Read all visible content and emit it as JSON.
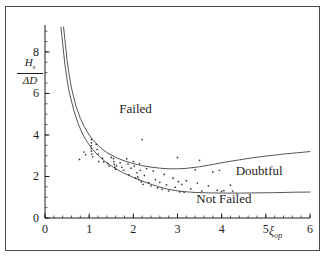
{
  "figure": {
    "background": "#ffffff",
    "border_color": "#4a4a4a",
    "ink_color": "#1c1c1c",
    "curve_color": "#555555",
    "point_color": "#333333"
  },
  "axes": {
    "y_title_numerator": "H",
    "y_title_numerator_sub": "s",
    "y_title_denominator": "ΔD",
    "x_title": "ξ",
    "x_title_sub": "op",
    "x_ticks": [
      0,
      1,
      2,
      3,
      4,
      5,
      6
    ],
    "x_tick_labels": [
      "0",
      "1",
      "2",
      "3",
      "4",
      "5",
      "6"
    ],
    "y_ticks": [
      0,
      2,
      4,
      6,
      8
    ],
    "y_tick_labels": [
      "0",
      "2",
      "4",
      "6",
      "8"
    ],
    "x_minor_step": 0.2,
    "y_minor_step": 0.5,
    "xlim": [
      0,
      6
    ],
    "ylim": [
      0,
      9.2
    ]
  },
  "regions": [
    {
      "name": "failed",
      "label": "Failed",
      "x": 2.05,
      "y": 5.05
    },
    {
      "name": "doubtful",
      "label": "Doubtful",
      "x": 4.85,
      "y": 2.05
    },
    {
      "name": "not-failed",
      "label": "Not Failed",
      "x": 4.05,
      "y": 0.72
    }
  ],
  "chart_data": {
    "type": "scatter",
    "title": "",
    "xlabel": "ξ_op",
    "ylabel": "H_s / ΔD",
    "xlim": [
      0,
      6
    ],
    "ylim": [
      0,
      9.2
    ],
    "grid": false,
    "legend": null,
    "series": [
      {
        "name": "upper-boundary-curve",
        "type": "line",
        "comment": "Boundary between Failed (above) and Doubtful (below)",
        "points": [
          [
            0.42,
            9.2
          ],
          [
            0.45,
            8.6
          ],
          [
            0.5,
            7.6
          ],
          [
            0.55,
            6.85
          ],
          [
            0.6,
            6.25
          ],
          [
            0.7,
            5.4
          ],
          [
            0.8,
            4.8
          ],
          [
            0.9,
            4.35
          ],
          [
            1.0,
            4.0
          ],
          [
            1.1,
            3.72
          ],
          [
            1.25,
            3.4
          ],
          [
            1.4,
            3.15
          ],
          [
            1.6,
            2.92
          ],
          [
            1.8,
            2.75
          ],
          [
            2.0,
            2.62
          ],
          [
            2.2,
            2.52
          ],
          [
            2.4,
            2.45
          ],
          [
            2.6,
            2.4
          ],
          [
            2.8,
            2.37
          ],
          [
            3.0,
            2.37
          ],
          [
            3.2,
            2.39
          ],
          [
            3.5,
            2.47
          ],
          [
            3.8,
            2.58
          ],
          [
            4.1,
            2.7
          ],
          [
            4.4,
            2.8
          ],
          [
            4.7,
            2.9
          ],
          [
            5.0,
            2.98
          ],
          [
            5.4,
            3.08
          ],
          [
            5.7,
            3.14
          ],
          [
            6.0,
            3.2
          ]
        ]
      },
      {
        "name": "lower-boundary-curve",
        "type": "line",
        "comment": "Boundary between Doubtful (above) and Not Failed (below)",
        "points": [
          [
            0.36,
            9.2
          ],
          [
            0.4,
            8.4
          ],
          [
            0.45,
            7.4
          ],
          [
            0.5,
            6.65
          ],
          [
            0.55,
            6.05
          ],
          [
            0.65,
            5.2
          ],
          [
            0.75,
            4.55
          ],
          [
            0.85,
            4.05
          ],
          [
            0.95,
            3.68
          ],
          [
            1.05,
            3.38
          ],
          [
            1.2,
            3.02
          ],
          [
            1.35,
            2.74
          ],
          [
            1.55,
            2.44
          ],
          [
            1.75,
            2.2
          ],
          [
            1.95,
            2.0
          ],
          [
            2.15,
            1.82
          ],
          [
            2.35,
            1.66
          ],
          [
            2.55,
            1.52
          ],
          [
            2.75,
            1.4
          ],
          [
            2.95,
            1.32
          ],
          [
            3.15,
            1.27
          ],
          [
            3.4,
            1.23
          ],
          [
            3.7,
            1.21
          ],
          [
            4.0,
            1.2
          ],
          [
            4.4,
            1.2
          ],
          [
            4.8,
            1.21
          ],
          [
            5.2,
            1.22
          ],
          [
            5.6,
            1.24
          ],
          [
            6.0,
            1.25
          ]
        ]
      },
      {
        "name": "data-points",
        "type": "scatter",
        "marker": "dot",
        "points": [
          [
            0.78,
            2.82
          ],
          [
            0.88,
            3.18
          ],
          [
            0.92,
            3.05
          ],
          [
            1.05,
            3.78
          ],
          [
            1.05,
            3.62
          ],
          [
            1.05,
            3.48
          ],
          [
            1.05,
            3.35
          ],
          [
            1.05,
            3.22
          ],
          [
            1.06,
            3.08
          ],
          [
            1.08,
            2.95
          ],
          [
            1.16,
            3.55
          ],
          [
            1.18,
            3.3
          ],
          [
            1.2,
            3.08
          ],
          [
            1.22,
            2.72
          ],
          [
            1.3,
            2.88
          ],
          [
            1.33,
            2.7
          ],
          [
            1.42,
            2.62
          ],
          [
            1.45,
            2.5
          ],
          [
            1.5,
            2.92
          ],
          [
            1.55,
            2.86
          ],
          [
            1.56,
            2.72
          ],
          [
            1.57,
            2.58
          ],
          [
            1.58,
            2.45
          ],
          [
            1.6,
            2.35
          ],
          [
            1.62,
            2.52
          ],
          [
            1.7,
            2.66
          ],
          [
            1.74,
            2.44
          ],
          [
            1.78,
            2.3
          ],
          [
            1.85,
            2.85
          ],
          [
            1.88,
            2.6
          ],
          [
            1.9,
            2.08
          ],
          [
            1.95,
            2.4
          ],
          [
            2.0,
            2.72
          ],
          [
            2.02,
            2.5
          ],
          [
            2.05,
            1.92
          ],
          [
            2.08,
            2.18
          ],
          [
            2.1,
            1.98
          ],
          [
            2.12,
            1.86
          ],
          [
            2.14,
            2.62
          ],
          [
            2.16,
            2.3
          ],
          [
            2.18,
            1.74
          ],
          [
            2.2,
            3.78
          ],
          [
            2.22,
            1.62
          ],
          [
            2.25,
            2.05
          ],
          [
            2.3,
            2.38
          ],
          [
            2.35,
            1.7
          ],
          [
            2.4,
            1.55
          ],
          [
            2.45,
            2.26
          ],
          [
            2.5,
            1.85
          ],
          [
            2.55,
            1.45
          ],
          [
            2.6,
            1.72
          ],
          [
            2.65,
            1.38
          ],
          [
            2.7,
            2.1
          ],
          [
            2.75,
            1.6
          ],
          [
            2.8,
            1.3
          ],
          [
            2.9,
            1.92
          ],
          [
            2.95,
            1.48
          ],
          [
            3.0,
            2.92
          ],
          [
            3.02,
            1.75
          ],
          [
            3.05,
            1.26
          ],
          [
            3.1,
            1.62
          ],
          [
            3.15,
            1.24
          ],
          [
            3.2,
            1.8
          ],
          [
            3.3,
            1.4
          ],
          [
            3.4,
            2.32
          ],
          [
            3.45,
            1.68
          ],
          [
            3.5,
            2.78
          ],
          [
            3.55,
            1.3
          ],
          [
            3.7,
            1.55
          ],
          [
            3.8,
            2.22
          ],
          [
            3.9,
            1.34
          ],
          [
            3.95,
            2.3
          ],
          [
            4.0,
            1.28
          ],
          [
            4.05,
            1.32
          ],
          [
            4.2,
            1.58
          ],
          [
            4.25,
            1.3
          ]
        ]
      }
    ]
  }
}
